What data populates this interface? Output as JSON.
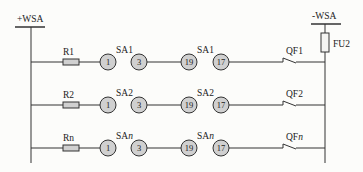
{
  "buses": {
    "positive": {
      "label": "+WSA"
    },
    "negative": {
      "label": "-WSA"
    }
  },
  "fuse": {
    "label": "FU2"
  },
  "colors": {
    "line": "#333333",
    "circle_fill": "#d0d0d0",
    "resistor_fill": "#d0d0d0",
    "background": "#fcfcfa"
  },
  "rows": [
    {
      "resistor": "R1",
      "switch_a_prefix": "SA",
      "switch_a_suffix": "1",
      "switch_b_prefix": "SA",
      "switch_b_suffix": "1",
      "breaker_prefix": "QF",
      "breaker_suffix": "1",
      "contacts": [
        "1",
        "3",
        "19",
        "17"
      ]
    },
    {
      "resistor": "R2",
      "switch_a_prefix": "SA",
      "switch_a_suffix": "2",
      "switch_b_prefix": "SA",
      "switch_b_suffix": "2",
      "breaker_prefix": "QF",
      "breaker_suffix": "2",
      "contacts": [
        "1",
        "3",
        "19",
        "17"
      ]
    },
    {
      "resistor": "Rn",
      "switch_a_prefix": "SA",
      "switch_a_suffix": "n",
      "switch_b_prefix": "SA",
      "switch_b_suffix": "n",
      "breaker_prefix": "QF",
      "breaker_suffix": "n",
      "contacts": [
        "1",
        "3",
        "19",
        "17"
      ]
    }
  ]
}
